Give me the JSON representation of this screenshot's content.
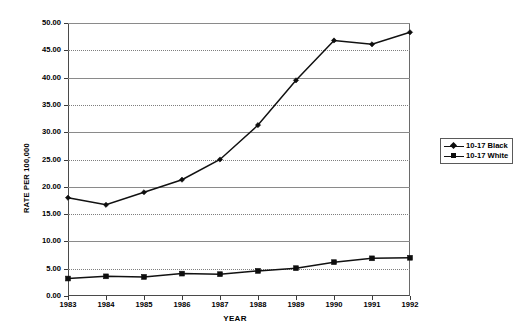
{
  "chart_data": {
    "type": "line",
    "title": "",
    "xlabel": "YEAR",
    "ylabel": "RATE PER 100,000",
    "categories": [
      "1983",
      "1984",
      "1985",
      "1986",
      "1987",
      "1988",
      "1989",
      "1990",
      "1991",
      "1992"
    ],
    "x": [
      1983,
      1984,
      1985,
      1986,
      1987,
      1988,
      1989,
      1990,
      1991,
      1992
    ],
    "series": [
      {
        "name": "10-17 Black",
        "marker": "diamond",
        "color": "#0d0d0d",
        "values": [
          18.0,
          16.7,
          19.0,
          21.3,
          25.0,
          31.3,
          39.5,
          46.8,
          46.1,
          48.3
        ]
      },
      {
        "name": "10-17 White",
        "marker": "square",
        "color": "#0d0d0d",
        "values": [
          3.2,
          3.6,
          3.5,
          4.1,
          4.0,
          4.6,
          5.1,
          6.2,
          6.9,
          7.0
        ]
      }
    ],
    "ylim": [
      0,
      50
    ],
    "ytick_step": 5,
    "ytick_labels": [
      "0.00",
      "5.00",
      "10.00",
      "15.00",
      "20.00",
      "25.00",
      "30.00",
      "35.00",
      "40.00",
      "45.00",
      "50.00"
    ],
    "ytick_values": [
      0,
      5,
      10,
      15,
      20,
      25,
      30,
      35,
      40,
      45,
      50
    ],
    "grid": true,
    "grid_axis": "y",
    "legend_position": "right",
    "legend_entries": [
      "10-17 Black",
      "10-17 White"
    ]
  },
  "legend": {
    "entries": [
      {
        "label": "10-17 Black",
        "marker": "diamond"
      },
      {
        "label": "10-17 White",
        "marker": "square"
      }
    ]
  }
}
